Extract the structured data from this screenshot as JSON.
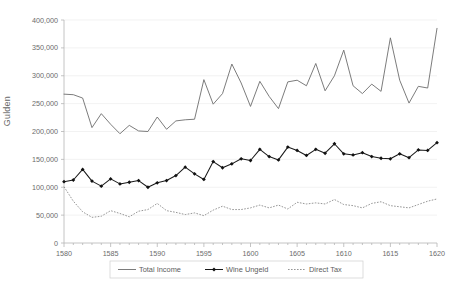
{
  "chart_data": {
    "type": "line",
    "title": "",
    "xlabel": "",
    "ylabel": "Gulden",
    "xlim": [
      1580,
      1620
    ],
    "ylim": [
      0,
      400000
    ],
    "grid": true,
    "legend_position": "bottom",
    "x": [
      1580,
      1581,
      1582,
      1583,
      1584,
      1585,
      1586,
      1587,
      1588,
      1589,
      1590,
      1591,
      1592,
      1593,
      1594,
      1595,
      1596,
      1597,
      1598,
      1599,
      1600,
      1601,
      1602,
      1603,
      1604,
      1605,
      1606,
      1607,
      1608,
      1609,
      1610,
      1611,
      1612,
      1613,
      1614,
      1615,
      1616,
      1617,
      1618,
      1619,
      1620
    ],
    "x_tick_labels": [
      "1580",
      "1585",
      "1590",
      "1595",
      "1600",
      "1605",
      "1610",
      "1615",
      "1620"
    ],
    "y_tick_labels": [
      "0",
      "50,000",
      "100,000",
      "150,000",
      "200,000",
      "250,000",
      "300,000",
      "350,000",
      "400,000"
    ],
    "y_ticks": [
      0,
      50000,
      100000,
      150000,
      200000,
      250000,
      300000,
      350000,
      400000
    ],
    "series": [
      {
        "name": "Total Income",
        "style": "solid",
        "marker": "none",
        "color": "#6d6d6d",
        "values": [
          267000,
          266000,
          260000,
          207000,
          232000,
          213000,
          196000,
          211000,
          201000,
          200000,
          226000,
          204000,
          219000,
          221000,
          222000,
          293000,
          249000,
          268000,
          321000,
          287000,
          245000,
          290000,
          263000,
          241000,
          289000,
          292000,
          282000,
          322000,
          273000,
          300000,
          346000,
          282000,
          268000,
          285000,
          272000,
          368000,
          292000,
          251000,
          281000,
          278000,
          385000
        ]
      },
      {
        "name": "Wine Ungeld",
        "style": "solid",
        "marker": "diamond",
        "color": "#111111",
        "values": [
          110000,
          113000,
          132000,
          111000,
          102000,
          115000,
          106000,
          109000,
          112000,
          100000,
          108000,
          112000,
          121000,
          136000,
          124000,
          114000,
          146000,
          135000,
          142000,
          151000,
          148000,
          168000,
          155000,
          149000,
          172000,
          166000,
          157000,
          168000,
          161000,
          178000,
          160000,
          158000,
          162000,
          155000,
          152000,
          151000,
          160000,
          153000,
          167000,
          166000,
          180000
        ]
      },
      {
        "name": "Direct Tax",
        "style": "dotted",
        "marker": "none",
        "color": "#8a8a8a",
        "values": [
          101000,
          75000,
          56000,
          46000,
          48000,
          58000,
          53000,
          47000,
          57000,
          60000,
          71000,
          58000,
          55000,
          51000,
          54000,
          49000,
          59000,
          66000,
          60000,
          60000,
          63000,
          68000,
          63000,
          68000,
          61000,
          73000,
          70000,
          72000,
          70000,
          78000,
          69000,
          67000,
          63000,
          71000,
          74000,
          67000,
          65000,
          63000,
          69000,
          75000,
          79000
        ]
      }
    ]
  },
  "axis": {
    "y_title": "Gulden"
  },
  "legend": {
    "items": [
      {
        "label": "Total Income"
      },
      {
        "label": "Wine Ungeld"
      },
      {
        "label": "Direct Tax"
      }
    ]
  }
}
